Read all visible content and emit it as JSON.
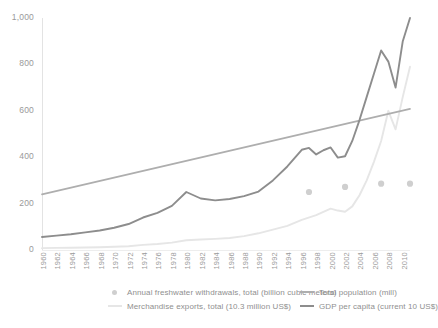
{
  "chart_data": {
    "type": "line",
    "title": "",
    "xlabel": "",
    "ylabel": "",
    "ylim": [
      0,
      1000
    ],
    "xlim": [
      1960,
      2011
    ],
    "grid": false,
    "legend_position": "bottom",
    "y_ticks": [
      "0",
      "200",
      "400",
      "600",
      "800",
      "1,000"
    ],
    "y_tick_values": [
      0,
      200,
      400,
      600,
      800,
      1000
    ],
    "x_ticks": [
      "1960",
      "1962",
      "1964",
      "1966",
      "1968",
      "1970",
      "1972",
      "1974",
      "1976",
      "1978",
      "1980",
      "1982",
      "1984",
      "1986",
      "1988",
      "1990",
      "1992",
      "1994",
      "1996",
      "1998",
      "2000",
      "2002",
      "2004",
      "2006",
      "2008",
      "2010"
    ],
    "x_tick_values": [
      1960,
      1962,
      1964,
      1966,
      1968,
      1970,
      1972,
      1974,
      1976,
      1978,
      1980,
      1982,
      1984,
      1986,
      1988,
      1990,
      1992,
      1994,
      1996,
      1998,
      2000,
      2002,
      2004,
      2006,
      2008,
      2010
    ],
    "series": [
      {
        "name": "Annual freshwater withdrawals, total (billion cubic meters)",
        "color": "#cfcfcf",
        "marker": "dot",
        "style": "scatter",
        "x": [
          1997,
          2002,
          2007,
          2011
        ],
        "values": [
          250,
          272,
          286,
          286
        ]
      },
      {
        "name": "Merchandise exports, total (10.3 million US$)",
        "color": "#e6e6e6",
        "marker": "none",
        "style": "line",
        "x": [
          1960,
          1962,
          1964,
          1966,
          1968,
          1970,
          1972,
          1974,
          1976,
          1978,
          1980,
          1982,
          1984,
          1986,
          1988,
          1990,
          1992,
          1994,
          1996,
          1998,
          2000,
          2001,
          2002,
          2003,
          2004,
          2005,
          2006,
          2007,
          2008,
          2009,
          2010,
          2011
        ],
        "values": [
          8,
          9,
          10,
          11,
          12,
          14,
          16,
          22,
          26,
          32,
          42,
          45,
          48,
          52,
          60,
          72,
          88,
          104,
          130,
          150,
          178,
          170,
          165,
          188,
          236,
          300,
          380,
          470,
          600,
          520,
          660,
          790
        ]
      },
      {
        "name": "Total population (mill)",
        "color": "#aeaeae",
        "marker": "none",
        "style": "line",
        "x": [
          1960,
          2011
        ],
        "values": [
          240,
          608
        ]
      },
      {
        "name": "GDP per capita (current 10 US$)",
        "color": "#8d8d8d",
        "marker": "none",
        "style": "line",
        "x": [
          1960,
          1962,
          1964,
          1966,
          1968,
          1970,
          1972,
          1974,
          1976,
          1978,
          1980,
          1982,
          1984,
          1986,
          1988,
          1990,
          1992,
          1994,
          1996,
          1997,
          1998,
          1999,
          2000,
          2001,
          2002,
          2003,
          2004,
          2005,
          2006,
          2007,
          2008,
          2009,
          2010,
          2011
        ],
        "values": [
          56,
          62,
          68,
          76,
          84,
          96,
          112,
          140,
          160,
          190,
          250,
          222,
          214,
          220,
          232,
          252,
          300,
          360,
          432,
          440,
          412,
          430,
          442,
          398,
          404,
          470,
          560,
          660,
          760,
          860,
          812,
          700,
          900,
          1000
        ]
      }
    ],
    "legend": [
      {
        "name": "Annual freshwater withdrawals, total (billion cubic meters)",
        "color": "#cfcfcf",
        "marker": "dot"
      },
      {
        "name": "Merchandise exports, total (10.3 million US$)",
        "color": "#e6e6e6",
        "marker": "line"
      },
      {
        "name": "Total population (mill)",
        "color": "#aeaeae",
        "marker": "line"
      },
      {
        "name": "GDP per capita (current 10 US$)",
        "color": "#8d8d8d",
        "marker": "line"
      }
    ],
    "colors": {
      "axis": "#e3e3e3",
      "tick_text": "#9a9a9a",
      "legend_text": "#8f8f8f",
      "background": "#ffffff"
    }
  }
}
